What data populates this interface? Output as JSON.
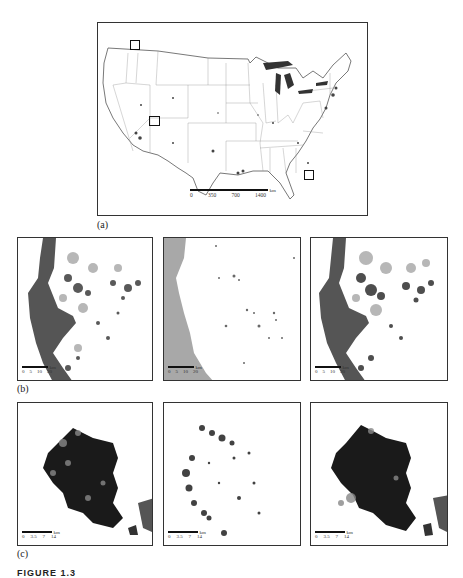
{
  "figure": {
    "caption_partial": "FIGURE 1.3",
    "panels": {
      "a": {
        "label": "(a)",
        "description": "Map of the conterminous United States showing state boundaries, urban/impervious areas and three inset study-area boxes",
        "scale_unit": "km",
        "scale_ticks": [
          "0",
          "350",
          "700",
          "1400"
        ],
        "insets": [
          {
            "name": "northwest-inset",
            "region": "Seattle area"
          },
          {
            "name": "southwest-inset",
            "region": "Las Vegas area"
          },
          {
            "name": "southeast-inset",
            "region": "Tampa area"
          }
        ]
      },
      "b": {
        "label": "(b)",
        "scale_unit": "km",
        "scale_ticks": [
          "0",
          "5",
          "10",
          "20"
        ],
        "maps": [
          {
            "name": "b-left"
          },
          {
            "name": "b-middle"
          },
          {
            "name": "b-right"
          }
        ]
      },
      "c": {
        "label": "(c)",
        "scale_unit": "km",
        "scale_ticks": [
          "0",
          "3.5",
          "7",
          "14"
        ],
        "maps": [
          {
            "name": "c-left"
          },
          {
            "name": "c-middle"
          },
          {
            "name": "c-right"
          }
        ]
      }
    },
    "colors": {
      "frame": "#333333",
      "water": "#555555",
      "ocean_light": "#a8a8a8",
      "urban_dark": "#1a1a1a",
      "urban_mid": "#888888"
    }
  }
}
